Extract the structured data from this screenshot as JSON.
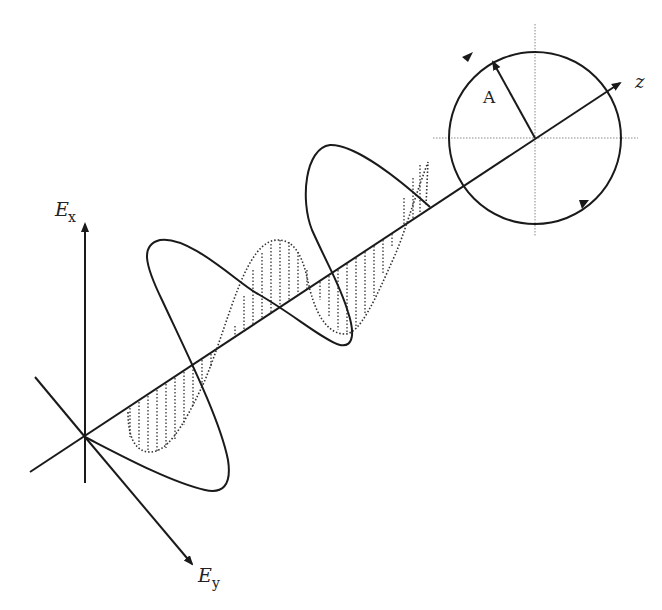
{
  "diagram": {
    "labels": {
      "ex_main": "E",
      "ex_sub": "x",
      "ey_main": "E",
      "ey_sub": "y",
      "z": "z",
      "amplitude": "A"
    },
    "colors": {
      "stroke": "#1a1a1a",
      "guide": "#888888",
      "background": "#ffffff"
    },
    "geometry": {
      "origin": [
        85,
        437
      ],
      "z_axis_end": [
        616,
        85
      ],
      "ex_axis_end": [
        85,
        222
      ],
      "ey_axis_end": [
        193,
        565
      ],
      "circle_center": [
        535,
        138
      ],
      "circle_radius": 86
    }
  }
}
